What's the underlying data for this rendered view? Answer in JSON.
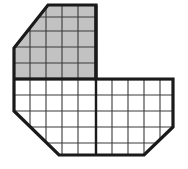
{
  "figure": {
    "canvas": {
      "width": 188,
      "height": 169,
      "background": "#ffffff"
    },
    "colors": {
      "outline": "#1a1a1a",
      "grid_line": "#3a3a3a",
      "shading_fill": "#c2c2c2",
      "unshaded_fill": "#ffffff",
      "shading_edge": "#9a9a9a"
    },
    "stroke_widths": {
      "outline": 3.2,
      "major_grid": 1.9,
      "minor_grid": 1.1
    },
    "grid": {
      "cell_size": 16,
      "origin_x": 14,
      "origin_y": 15,
      "columns": 10,
      "rows": 9,
      "x_positions": [
        14,
        30,
        46,
        62,
        78,
        96,
        112,
        128,
        144,
        160,
        173
      ],
      "y_positions": [
        5,
        17,
        31,
        47,
        63,
        79,
        95,
        111,
        127,
        143,
        155
      ]
    },
    "outline_polygon": {
      "name": "main-shape-outline",
      "points": "48,5 96,5 96,79 173,79 173,127 144,155 59,155 14,111 14,48",
      "vertices": [
        {
          "label": "top-left-diagonal-top",
          "x": 48,
          "y": 5
        },
        {
          "label": "top-right",
          "x": 96,
          "y": 5
        },
        {
          "label": "notch-inner-corner",
          "x": 96,
          "y": 79
        },
        {
          "label": "right-top",
          "x": 173,
          "y": 79
        },
        {
          "label": "right-diagonal-top",
          "x": 173,
          "y": 127
        },
        {
          "label": "bottom-right-diagonal-bottom",
          "x": 144,
          "y": 155
        },
        {
          "label": "bottom-left-diagonal-bottom",
          "x": 59,
          "y": 155
        },
        {
          "label": "left-diagonal-bottom",
          "x": 14,
          "y": 111
        },
        {
          "label": "left-diagonal-top",
          "x": 14,
          "y": 48
        }
      ]
    },
    "shaded_region": {
      "name": "shaded-area",
      "points": "48,5 96,5 96,79 14,79 14,48",
      "fill": "#c2c2c2",
      "cell_count_label": ""
    },
    "minor_grid_lines": {
      "vertical_x": [
        30,
        46,
        62,
        78,
        112,
        128,
        144,
        160
      ],
      "horizontal_y": [
        17,
        31,
        47,
        63,
        95,
        111,
        127,
        143
      ],
      "major_vertical_x": [
        96
      ],
      "major_horizontal_y": [
        79
      ]
    }
  }
}
